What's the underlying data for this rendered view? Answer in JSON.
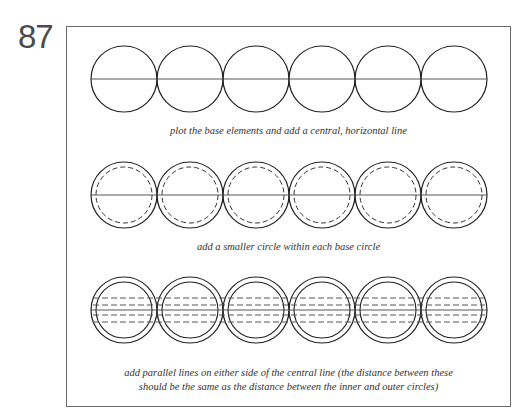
{
  "page_number": "87",
  "rows": [
    {
      "caption": "plot the base elements and add a central, horizontal line"
    },
    {
      "caption": "add a smaller circle within each base circle"
    },
    {
      "caption_line1": "add parallel lines on either side of the central line (the distance between these",
      "caption_line2": "should be the same as the distance between the inner and outer circles)"
    }
  ],
  "geometry": {
    "circle_count": 6,
    "outer_radius": 33,
    "inner_radius": 28,
    "first_center_x": 124,
    "spacing": 66,
    "row_centers_y": [
      79,
      195,
      310
    ]
  }
}
